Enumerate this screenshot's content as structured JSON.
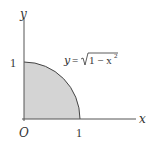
{
  "diagram": {
    "axes": {
      "x_label": "x",
      "y_label": "y",
      "origin_label": "O",
      "x_tick_label": "1",
      "y_tick_label": "1"
    },
    "curve": {
      "equation_lhs": "y",
      "equation_eq": "=",
      "equation_radicand": "1 − x",
      "equation_exponent": "2"
    },
    "colors": {
      "axis": "#555555",
      "curve": "#444444",
      "fill": "#d4d4d4",
      "text": "#333333"
    }
  }
}
